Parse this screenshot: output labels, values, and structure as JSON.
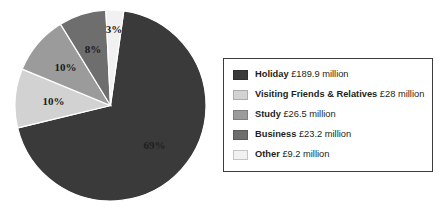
{
  "chart_data": {
    "type": "pie",
    "title": "",
    "subtitle": "",
    "xlabel": "",
    "ylabel": "",
    "grid": false,
    "legend_position": "right",
    "unit": "£ million",
    "currency_symbol": "£",
    "total_value": 276.8,
    "categories": [
      "Holiday",
      "Visiting Friends & Relatives",
      "Study",
      "Business",
      "Other"
    ],
    "values": [
      189.9,
      28,
      26.5,
      23.2,
      9.2
    ],
    "percent_labels": [
      "69%",
      "10%",
      "10%",
      "8%",
      "3%"
    ],
    "percents": [
      69,
      10,
      10,
      8,
      3
    ],
    "colors": [
      "#3a3a3a",
      "#d2d2d2",
      "#9b9b9b",
      "#6e6e6e",
      "#f1f1f1"
    ],
    "slices": [
      {
        "name": "Holiday",
        "value": 189.9,
        "value_text": "£189.9 million",
        "percent": 69,
        "percent_label": "69%",
        "color": "#3a3a3a",
        "label_on_dark": true
      },
      {
        "name": "Visiting Friends & Relatives",
        "value": 28,
        "value_text": "£28 million",
        "percent": 10,
        "percent_label": "10%",
        "color": "#d2d2d2",
        "label_on_dark": false
      },
      {
        "name": "Study",
        "value": 26.5,
        "value_text": "£26.5 million",
        "percent": 10,
        "percent_label": "10%",
        "color": "#9b9b9b",
        "label_on_dark": false
      },
      {
        "name": "Business",
        "value": 23.2,
        "value_text": "£23.2 million",
        "percent": 8,
        "percent_label": "8%",
        "color": "#6e6e6e",
        "label_on_dark": false
      },
      {
        "name": "Other",
        "value": 9.2,
        "value_text": "£9.2 million",
        "percent": 3,
        "percent_label": "3%",
        "color": "#f1f1f1",
        "label_on_dark": false
      }
    ]
  },
  "legend": {
    "border_color": "#3c3c3c",
    "items": [
      {
        "name": "Holiday",
        "value_text": "£189.9 million",
        "color": "#3a3a3a"
      },
      {
        "name": "Visiting Friends & Relatives",
        "value_text": "£28 million",
        "color": "#d2d2d2"
      },
      {
        "name": "Study",
        "value_text": "£26.5 million",
        "color": "#9b9b9b"
      },
      {
        "name": "Business",
        "value_text": "£23.2 million",
        "color": "#6e6e6e"
      },
      {
        "name": "Other",
        "value_text": "£9.2 million",
        "color": "#f1f1f1"
      }
    ]
  }
}
